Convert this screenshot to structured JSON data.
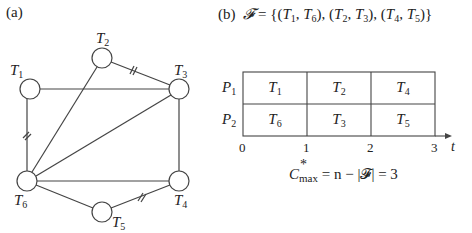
{
  "panel_a": {
    "label": "(a)",
    "nodes": [
      {
        "id": "T1",
        "name": "T",
        "sub": "1",
        "cx": 30,
        "cy": 89
      },
      {
        "id": "T2",
        "name": "T",
        "sub": "2",
        "cx": 102,
        "cy": 58
      },
      {
        "id": "T3",
        "name": "T",
        "sub": "3",
        "cx": 179,
        "cy": 89
      },
      {
        "id": "T4",
        "name": "T",
        "sub": "4",
        "cx": 179,
        "cy": 181
      },
      {
        "id": "T5",
        "name": "T",
        "sub": "5",
        "cx": 102,
        "cy": 212
      },
      {
        "id": "T6",
        "name": "T",
        "sub": "6",
        "cx": 27,
        "cy": 181
      }
    ],
    "edges": [
      {
        "from": "T1",
        "to": "T3",
        "marked": false
      },
      {
        "from": "T1",
        "to": "T6",
        "marked": true
      },
      {
        "from": "T2",
        "to": "T3",
        "marked": true
      },
      {
        "from": "T2",
        "to": "T6",
        "marked": false
      },
      {
        "from": "T3",
        "to": "T6",
        "marked": false
      },
      {
        "from": "T3",
        "to": "T4",
        "marked": false
      },
      {
        "from": "T6",
        "to": "T4",
        "marked": false
      },
      {
        "from": "T6",
        "to": "T5",
        "marked": false
      },
      {
        "from": "T5",
        "to": "T4",
        "marked": true
      }
    ]
  },
  "panel_b": {
    "label": "(b)",
    "matching_formula": "𝓕 = {(T1, T6), (T2, T3), (T4, T5)}",
    "matching_prefix": "𝓕 = {(",
    "pairs": [
      [
        "T1",
        "T6"
      ],
      [
        "T2",
        "T3"
      ],
      [
        "T4",
        "T5"
      ]
    ],
    "gantt": {
      "rows": [
        {
          "processor": "P",
          "sub": "1",
          "tasks": [
            {
              "name": "T",
              "sub": "1"
            },
            {
              "name": "T",
              "sub": "2"
            },
            {
              "name": "T",
              "sub": "4"
            }
          ]
        },
        {
          "processor": "P",
          "sub": "2",
          "tasks": [
            {
              "name": "T",
              "sub": "6"
            },
            {
              "name": "T",
              "sub": "3"
            },
            {
              "name": "T",
              "sub": "5"
            }
          ]
        }
      ],
      "axis_ticks": [
        "0",
        "1",
        "2",
        "3"
      ],
      "axis_label": "t"
    },
    "result": {
      "lhs": "C",
      "sup": "*",
      "sub": "max",
      "rhs": "= n − |𝓕| = 3"
    }
  }
}
